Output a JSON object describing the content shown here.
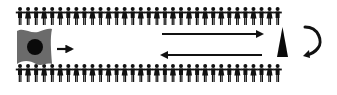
{
  "diagram": {
    "width": 337,
    "height": 95,
    "background": "#ffffff",
    "colors": {
      "figure": "#111111",
      "cell_body": "#6b6b6b",
      "cell_nucleus": "#0a0a0a",
      "arrow": "#111111",
      "triangle": "#0a0a0a"
    },
    "figure_rows": [
      {
        "name": "top-row",
        "y": 7,
        "x_start": 16,
        "spacing": 8.05,
        "count": 33,
        "pattern": [
          "man",
          "woman"
        ]
      },
      {
        "name": "bottom-row",
        "y": 64,
        "x_start": 16,
        "spacing": 8.05,
        "count": 33,
        "pattern": [
          "man",
          "woman"
        ]
      }
    ],
    "cell": {
      "icon": "cell-with-nucleus-icon",
      "x": 17,
      "y": 29,
      "w": 35,
      "h": 36,
      "nucleus": {
        "cx": 35,
        "cy": 47,
        "r": 8
      }
    },
    "arrows": [
      {
        "name": "short-right-arrow",
        "direction": "right",
        "x1": 57,
        "x2": 72,
        "y": 49
      },
      {
        "name": "long-right-arrow",
        "direction": "right",
        "x1": 162,
        "x2": 262,
        "y": 34
      },
      {
        "name": "long-left-arrow",
        "direction": "left",
        "x1": 162,
        "x2": 262,
        "y": 55
      }
    ],
    "triangle": {
      "icon": "triangle-marker-icon",
      "points": "277,57 288,57 282.5,27"
    },
    "curved_arrow": {
      "icon": "curved-return-arrow-icon",
      "direction": "clockwise-down"
    }
  }
}
